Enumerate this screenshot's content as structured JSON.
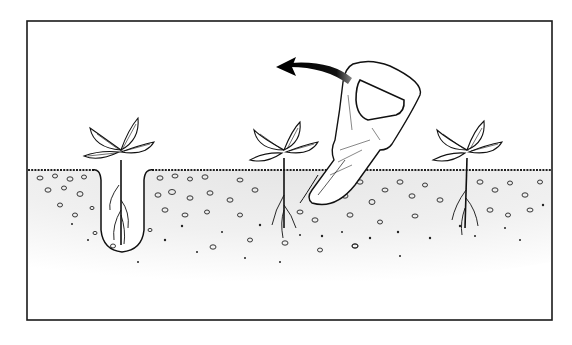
{
  "illustration": {
    "subject": "Transplanting seedlings with a dibber",
    "frame": {
      "x": 27,
      "y": 21,
      "width": 525,
      "height": 299,
      "stroke": "#1a1a1a"
    },
    "soil": {
      "surface_y": 170,
      "fill": "#f4f4f4",
      "stipple": "#2a2a2a"
    },
    "seedlings": [
      {
        "name": "seedling-in-hole",
        "x": 122
      },
      {
        "name": "seedling-middle",
        "x": 280
      },
      {
        "name": "seedling-right",
        "x": 465
      }
    ],
    "tool": {
      "name": "dibber",
      "tip": [
        312,
        200
      ]
    },
    "arrow": {
      "direction": "left",
      "color": "#111111"
    },
    "colors": {
      "ink": "#111111",
      "paper": "#ffffff"
    }
  }
}
